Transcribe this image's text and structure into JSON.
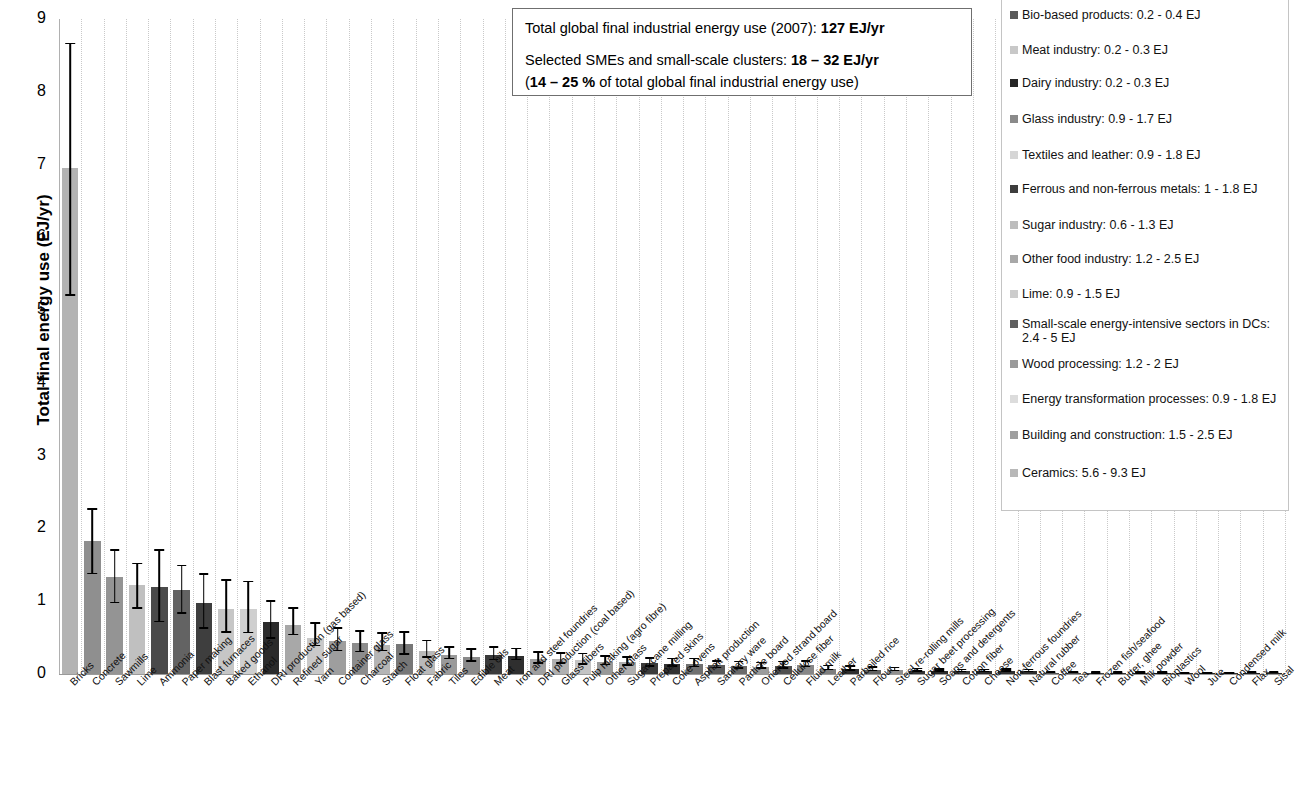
{
  "chart_data": {
    "type": "bar",
    "title": "",
    "xlabel": "",
    "ylabel": "Total final energy use (EJ/yr)",
    "ylim": [
      0,
      9
    ],
    "yticks": [
      "0",
      "1",
      "2",
      "3",
      "4",
      "5",
      "6",
      "7",
      "8",
      "9"
    ],
    "grid": true,
    "errorbars": true,
    "legend_position": "right",
    "categories": [
      "Bricks",
      "Concrete",
      "Sawmills",
      "Lime",
      "Ammonia",
      "Paper making",
      "Blast furnaces",
      "Baked goods",
      "Ethanol",
      "DRI production (gas based)",
      "Refined sugar",
      "Yarn",
      "Container glass",
      "Charcoal",
      "Starch",
      "Float glass",
      "Fabric",
      "Tiles",
      "Edible oils",
      "Meat",
      "Iron and steel foundries",
      "DRI production (coal based)",
      "Glass fibers",
      "Pulp making (agro fibre)",
      "Other glass",
      "Sugar cane milling",
      "Prepared skins",
      "Coke ovens",
      "Asphalt production",
      "Sanitary ware",
      "Particle board",
      "Oriented strand board",
      "Cellulose fiber",
      "Fluid milk",
      "Leather",
      "Parboiled rice",
      "Flour",
      "Steel re-rolling mills",
      "Sugar beet processing",
      "Soaps and detergents",
      "Cotton fiber",
      "Cheese",
      "Non-ferrous foundries",
      "Natural rubber",
      "Coffee",
      "Tea",
      "Frozen fish/seafood",
      "Butter, ghee",
      "Milk powder",
      "Bioplastics",
      "Wool",
      "Jute",
      "Condensed milk",
      "Flax",
      "Sisal"
    ],
    "values": [
      6.95,
      1.83,
      1.33,
      1.22,
      1.2,
      1.15,
      0.98,
      0.9,
      0.89,
      0.71,
      0.68,
      0.5,
      0.46,
      0.42,
      0.4,
      0.41,
      0.32,
      0.26,
      0.24,
      0.26,
      0.25,
      0.21,
      0.2,
      0.19,
      0.17,
      0.16,
      0.15,
      0.14,
      0.14,
      0.12,
      0.11,
      0.1,
      0.11,
      0.12,
      0.075,
      0.07,
      0.06,
      0.055,
      0.045,
      0.04,
      0.035,
      0.035,
      0.04,
      0.035,
      0.012,
      0.012,
      0.01,
      0.009,
      0.009,
      0.009,
      0.008,
      0.008,
      0.008,
      0.012,
      0.012
    ],
    "err_low": [
      5.2,
      1.37,
      0.97,
      0.9,
      0.71,
      0.83,
      0.62,
      0.57,
      0.56,
      0.48,
      0.53,
      0.38,
      0.31,
      0.3,
      0.31,
      0.26,
      0.22,
      0.2,
      0.17,
      0.19,
      0.19,
      0.14,
      0.14,
      0.13,
      0.12,
      0.11,
      0.1,
      0.1,
      0.09,
      0.08,
      0.07,
      0.07,
      0.07,
      0.09,
      0.05,
      0.045,
      0.04,
      0.035,
      0.03,
      0.027,
      0.023,
      0.023,
      0.027,
      0.023,
      0.008,
      0.008,
      0.007,
      0.006,
      0.006,
      0.006,
      0.005,
      0.005,
      0.005,
      0.008,
      0.008
    ],
    "err_high": [
      8.65,
      2.26,
      1.69,
      1.51,
      1.69,
      1.48,
      1.36,
      1.28,
      1.26,
      0.99,
      0.9,
      0.69,
      0.62,
      0.58,
      0.55,
      0.57,
      0.45,
      0.36,
      0.33,
      0.36,
      0.34,
      0.29,
      0.28,
      0.27,
      0.24,
      0.22,
      0.21,
      0.2,
      0.2,
      0.17,
      0.16,
      0.15,
      0.16,
      0.17,
      0.105,
      0.1,
      0.085,
      0.08,
      0.065,
      0.058,
      0.05,
      0.05,
      0.058,
      0.05,
      0.018,
      0.018,
      0.015,
      0.013,
      0.013,
      0.013,
      0.012,
      0.012,
      0.012,
      0.018,
      0.018
    ],
    "bar_shades": [
      "#b3b3b3",
      "#8f8f8f",
      "#949494",
      "#c0c0c0",
      "#4a4a4a",
      "#636363",
      "#3e3e3e",
      "#c6c6c6",
      "#cfcfcf",
      "#2b2b2b",
      "#a8a8a8",
      "#c9c9c9",
      "#9e9e9e",
      "#8c8c8c",
      "#b5b5b5",
      "#777777",
      "#b9b9b9",
      "#9a9a9a",
      "#8a8a8a",
      "#3a3a3a",
      "#2f2f2f",
      "#a0a0a0",
      "#b0b0b0",
      "#c4c4c4",
      "#989898",
      "#aeaeae",
      "#3c3c3c",
      "#333333",
      "#707070",
      "#5a5a5a",
      "#6b6b6b",
      "#9c9c9c",
      "#4f4f4f",
      "#878787",
      "#7e7e7e",
      "#2e2e2e",
      "#636363",
      "#8f8f8f",
      "#333333",
      "#2a2a2a",
      "#3a3a3a",
      "#2b2b2b",
      "#303030",
      "#2d2d2d",
      "#555555",
      "#4b4b4b",
      "#404040",
      "#353535",
      "#3a3a3a",
      "#303030",
      "#2b2b2b",
      "#2e2e2e",
      "#333333",
      "#1f1f1f",
      "#242424"
    ]
  },
  "callout": {
    "line1_text": "Total global final industrial energy use (2007): ",
    "line1_bold": "127 EJ/yr",
    "line2_text": "Selected SMEs and small-scale clusters: ",
    "line2_bold": "18 – 32 EJ/yr",
    "line3_open": "(",
    "line3_bold": "14 – 25 %",
    "line3_rest": " of total global final industrial energy use)"
  },
  "legend": {
    "items": [
      {
        "label": "Bio-based products: 0.2 - 0.4 EJ",
        "color": "#5a5a5a"
      },
      {
        "label": "Meat industry: 0.2 - 0.3 EJ",
        "color": "#c8c8c8"
      },
      {
        "label": "Dairy industry: 0.2 - 0.3 EJ",
        "color": "#262626"
      },
      {
        "label": "Glass industry: 0.9 - 1.7 EJ",
        "color": "#8a8a8a"
      },
      {
        "label": "Textiles and leather: 0.9 - 1.8 EJ",
        "color": "#d6d6d6"
      },
      {
        "label": "Ferrous and non-ferrous metals: 1 - 1.8 EJ",
        "color": "#3d3d3d"
      },
      {
        "label": "Sugar industry: 0.6 - 1.3 EJ",
        "color": "#bdbdbd"
      },
      {
        "label": "Other food industry: 1.2 - 2.5 EJ",
        "color": "#a8a8a8"
      },
      {
        "label": "Lime: 0.9 - 1.5 EJ",
        "color": "#cccccc"
      },
      {
        "label": "Small-scale energy-intensive sectors in DCs: 2.4 - 5 EJ",
        "color": "#5f5f5f"
      },
      {
        "label": "Wood processing: 1.2 - 2 EJ",
        "color": "#9a9a9a"
      },
      {
        "label": "Energy transformation processes: 0.9 - 1.8 EJ",
        "color": "#dcdcdc"
      },
      {
        "label": "Building and construction: 1.5 - 2.5 EJ",
        "color": "#9f9f9f"
      },
      {
        "label": "Ceramics: 5.6 - 9.3 EJ",
        "color": "#b8b8b8"
      }
    ]
  }
}
